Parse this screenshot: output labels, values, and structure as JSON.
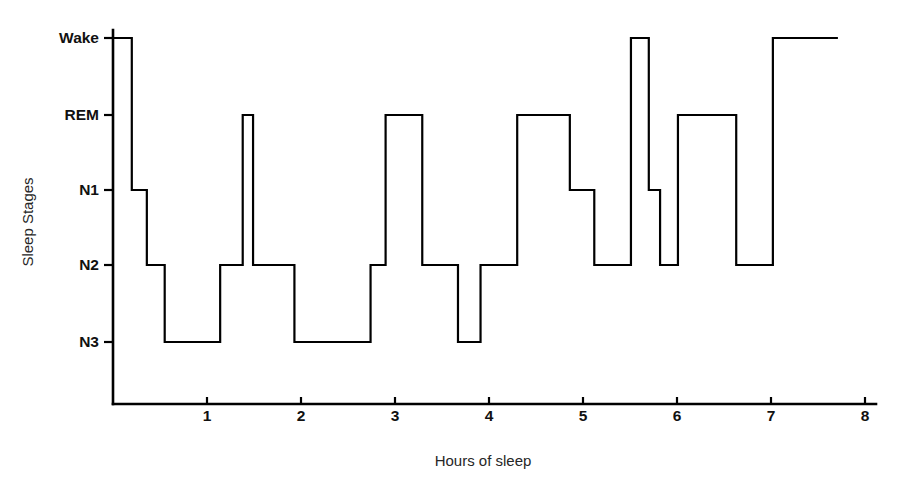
{
  "chart_data": {
    "type": "line",
    "subtype": "hypnogram-step",
    "title": "",
    "xlabel": "Hours of sleep",
    "ylabel": "Sleep Stages",
    "xlim": [
      0,
      8.2
    ],
    "ylim_categories": [
      "N3",
      "N2",
      "N1",
      "REM",
      "Wake"
    ],
    "grid": false,
    "legend": null,
    "line_color": "#000000",
    "background_color": "#ffffff",
    "xticks": [
      1,
      2,
      3,
      4,
      5,
      6,
      7,
      8
    ],
    "xtick_labels": [
      "1",
      "2",
      "3",
      "4",
      "5",
      "6",
      "7",
      "8"
    ],
    "yticks": [
      "Wake",
      "REM",
      "N1",
      "N2",
      "N3"
    ],
    "ytick_labels": [
      "Wake",
      "REM",
      "N1",
      "N2",
      "N3"
    ],
    "stage_levels": {
      "Wake": 5,
      "REM": 4,
      "N1": 3,
      "N2": 2,
      "N3": 1
    },
    "series": [
      {
        "name": "Sleep stage",
        "step_segments": [
          {
            "stage": "Wake",
            "start_hour": 0.0,
            "end_hour": 0.2
          },
          {
            "stage": "N1",
            "start_hour": 0.2,
            "end_hour": 0.36
          },
          {
            "stage": "N2",
            "start_hour": 0.36,
            "end_hour": 0.55
          },
          {
            "stage": "N3",
            "start_hour": 0.55,
            "end_hour": 1.14
          },
          {
            "stage": "N2",
            "start_hour": 1.14,
            "end_hour": 1.38
          },
          {
            "stage": "REM",
            "start_hour": 1.38,
            "end_hour": 1.49
          },
          {
            "stage": "N2",
            "start_hour": 1.49,
            "end_hour": 1.93
          },
          {
            "stage": "N3",
            "start_hour": 1.93,
            "end_hour": 2.74
          },
          {
            "stage": "N2",
            "start_hour": 2.74,
            "end_hour": 2.9
          },
          {
            "stage": "REM",
            "start_hour": 2.9,
            "end_hour": 3.29
          },
          {
            "stage": "N2",
            "start_hour": 3.29,
            "end_hour": 3.67
          },
          {
            "stage": "N3",
            "start_hour": 3.67,
            "end_hour": 3.91
          },
          {
            "stage": "N2",
            "start_hour": 3.91,
            "end_hour": 4.3
          },
          {
            "stage": "REM",
            "start_hour": 4.3,
            "end_hour": 4.86
          },
          {
            "stage": "N1",
            "start_hour": 4.86,
            "end_hour": 5.12
          },
          {
            "stage": "N2",
            "start_hour": 5.12,
            "end_hour": 5.51
          },
          {
            "stage": "Wake",
            "start_hour": 5.51,
            "end_hour": 5.7
          },
          {
            "stage": "N1",
            "start_hour": 5.7,
            "end_hour": 5.82
          },
          {
            "stage": "N2",
            "start_hour": 5.82,
            "end_hour": 6.01
          },
          {
            "stage": "REM",
            "start_hour": 6.01,
            "end_hour": 6.63
          },
          {
            "stage": "N2",
            "start_hour": 6.63,
            "end_hour": 7.02
          },
          {
            "stage": "Wake",
            "start_hour": 7.02,
            "end_hour": 7.7
          }
        ]
      }
    ]
  },
  "figure": {
    "xlabel": "Hours of sleep",
    "ylabel": "Sleep Stages"
  }
}
